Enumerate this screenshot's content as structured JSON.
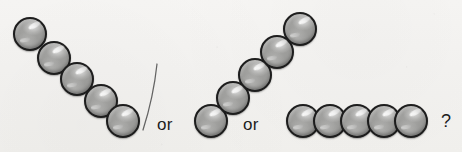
{
  "scene": {
    "title": "Circle sequence continuation puzzle",
    "width": 462,
    "height": 152,
    "background_color": "#f6f5f3"
  },
  "style": {
    "coin_fill_color": "#9b9b99",
    "coin_outline_color": "#1d1d1d",
    "highlight_color": "#ffffff",
    "text_color": "#1c1c1c",
    "stroke_color": "#4a4a4a"
  },
  "connectors": [
    {
      "name": "or-1",
      "text": "or",
      "x": 157,
      "y": 116
    },
    {
      "name": "or-2",
      "text": "or",
      "x": 243,
      "y": 116
    },
    {
      "name": "question-mark",
      "text": "?",
      "x": 441,
      "y": 112
    }
  ],
  "divider": {
    "name": "pen-stroke-divider",
    "from_x": 157,
    "from_y": 64,
    "to_x": 143,
    "to_y": 130
  },
  "groups": [
    {
      "name": "descending-diagonal-group",
      "description": "five circles stepping down to the right",
      "count": 5,
      "circles": [
        {
          "x": 13,
          "y": 17,
          "d": 34
        },
        {
          "x": 37,
          "y": 41,
          "d": 34
        },
        {
          "x": 60,
          "y": 62,
          "d": 34
        },
        {
          "x": 84,
          "y": 84,
          "d": 34
        },
        {
          "x": 106,
          "y": 104,
          "d": 34
        }
      ]
    },
    {
      "name": "ascending-diagonal-group",
      "description": "five circles stepping up to the right",
      "count": 5,
      "circles": [
        {
          "x": 194,
          "y": 104,
          "d": 34
        },
        {
          "x": 216,
          "y": 81,
          "d": 34
        },
        {
          "x": 238,
          "y": 58,
          "d": 34
        },
        {
          "x": 260,
          "y": 35,
          "d": 34
        },
        {
          "x": 283,
          "y": 12,
          "d": 34
        }
      ]
    },
    {
      "name": "horizontal-row-group",
      "description": "five circles in a straight horizontal row",
      "count": 5,
      "circles": [
        {
          "x": 286,
          "y": 104,
          "d": 34
        },
        {
          "x": 313,
          "y": 104,
          "d": 34
        },
        {
          "x": 340,
          "y": 104,
          "d": 34
        },
        {
          "x": 367,
          "y": 104,
          "d": 34
        },
        {
          "x": 394,
          "y": 104,
          "d": 34
        }
      ]
    }
  ]
}
